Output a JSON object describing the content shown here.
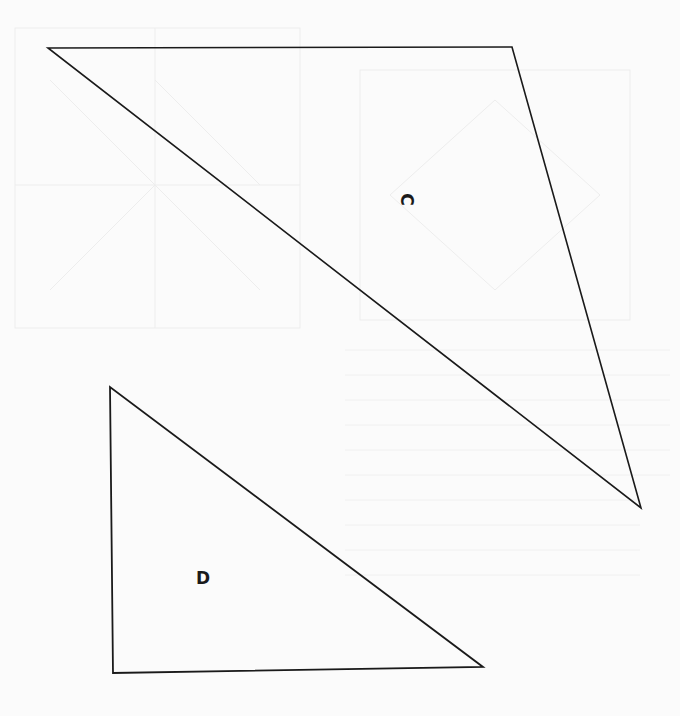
{
  "diagram": {
    "type": "geometric-shapes",
    "stroke_color": "#1a1a1a",
    "background_color": "#fbfbfb",
    "shapes": [
      {
        "id": "C",
        "kind": "triangle",
        "label": "C",
        "label_rotation_deg": 90,
        "vertices": [
          [
            48,
            48
          ],
          [
            512,
            47
          ],
          [
            641,
            508
          ]
        ],
        "label_position": [
          405,
          199
        ]
      },
      {
        "id": "D",
        "kind": "triangle",
        "label": "D",
        "label_rotation_deg": 0,
        "vertices": [
          [
            110,
            387
          ],
          [
            113,
            673
          ],
          [
            483,
            667
          ]
        ],
        "label_position": [
          202,
          578
        ]
      }
    ]
  }
}
